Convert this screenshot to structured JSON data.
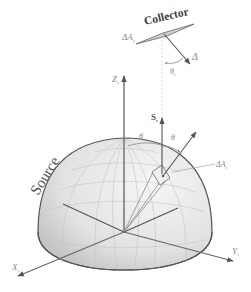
{
  "diagram": {
    "colors": {
      "line": "#555555",
      "dome_fill": "#e4e4e4",
      "dome_shadow": "#bdbdbd",
      "grid": "#c9c9c9",
      "collector_fill": "#cfcfcf",
      "label": "#555555"
    },
    "labels": {
      "collector": "Collector",
      "source": "Source",
      "collector_area": "ΔA",
      "collector_area_sub": "c",
      "source_area": "ΔA",
      "source_area_sub": "s",
      "collector_normal": "Δ",
      "theta_c": "θ",
      "theta_c_sub": "c",
      "theta_s_left": "θ",
      "theta_s_left_sub": "s",
      "theta_s_right": "θ",
      "theta_s_right_sub": "",
      "z_axis": "Z",
      "z_axis_sub": "s",
      "s_normal": "S",
      "s_normal_sub": "s",
      "x_axis": "X",
      "x_axis_sub": "s",
      "y_axis": "Y",
      "y_axis_sub": "s"
    },
    "nodes": [
      {
        "id": "collector",
        "label": "Collector",
        "shape": "parallelogram"
      },
      {
        "id": "source",
        "label": "Source",
        "shape": "hemisphere"
      },
      {
        "id": "source-element",
        "label": "ΔAs",
        "shape": "small-patch"
      }
    ],
    "edges": [
      {
        "from": "source-element",
        "to": "collector",
        "style": "dashed-vertical"
      },
      {
        "from": "source-element",
        "to": "collector-normal",
        "style": "arrow"
      }
    ]
  }
}
